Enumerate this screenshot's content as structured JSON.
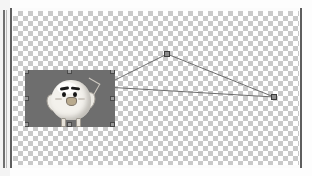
{
  "app": {
    "name": "image-editor-canvas",
    "surface": "transparent-artboard"
  },
  "canvas": {
    "label": "artboard",
    "width": 286,
    "height": 154,
    "background": "transparency-checkerboard",
    "checker_size_px": 5,
    "checker_light": "#ffffff",
    "checker_dark": "#c9c9c9",
    "border_color": "#5e5e5e"
  },
  "gutter": {
    "label": "left-rail",
    "rail_color": "#6f6f6f"
  },
  "selection": {
    "label": "selected-image-object",
    "x": 15,
    "y": 62,
    "width": 90,
    "height": 57,
    "fill": "#6e6e6e",
    "handle_fill": "#9a9a9a",
    "handle_stroke": "#4a4a4a",
    "handles": [
      {
        "name": "handle-top-left",
        "x": 0,
        "y": 0
      },
      {
        "name": "handle-top-center",
        "x": 42,
        "y": 0
      },
      {
        "name": "handle-top-right",
        "x": 85,
        "y": 0
      },
      {
        "name": "handle-middle-left",
        "x": 0,
        "y": 26
      },
      {
        "name": "handle-middle-right",
        "x": 85,
        "y": 26
      },
      {
        "name": "handle-bottom-left",
        "x": 0,
        "y": 52
      },
      {
        "name": "handle-bottom-center",
        "x": 42,
        "y": 52
      },
      {
        "name": "handle-bottom-right",
        "x": 85,
        "y": 52
      }
    ]
  },
  "artwork": {
    "label": "cartoon-bird-character",
    "description": "round white cartoon bird with thick black eyebrows, beak, wings and two legs",
    "body_color": "#f3f1ec",
    "outline_color": "#1b1b1b",
    "beak_color": "#b9aa8e"
  },
  "path": {
    "label": "connector-path",
    "stroke": "#6d6d6d",
    "stroke_width": 1,
    "points": [
      {
        "name": "path-point-origin",
        "x": 95,
        "y": 77
      },
      {
        "name": "path-point-apex",
        "x": 157,
        "y": 46
      },
      {
        "name": "path-point-right",
        "x": 264,
        "y": 89
      }
    ],
    "segments": [
      {
        "name": "segment-origin-to-apex",
        "from": "path-point-origin",
        "to": "path-point-apex"
      },
      {
        "name": "segment-apex-to-right",
        "from": "path-point-apex",
        "to": "path-point-right"
      },
      {
        "name": "segment-origin-to-right",
        "from": "path-point-origin",
        "to": "path-point-right"
      }
    ],
    "nodes": [
      {
        "name": "node-apex",
        "x": 157,
        "y": 46
      },
      {
        "name": "node-right",
        "x": 264,
        "y": 89
      }
    ],
    "node_fill": "#8b8b8b",
    "node_stroke": "#3d3d3d"
  }
}
